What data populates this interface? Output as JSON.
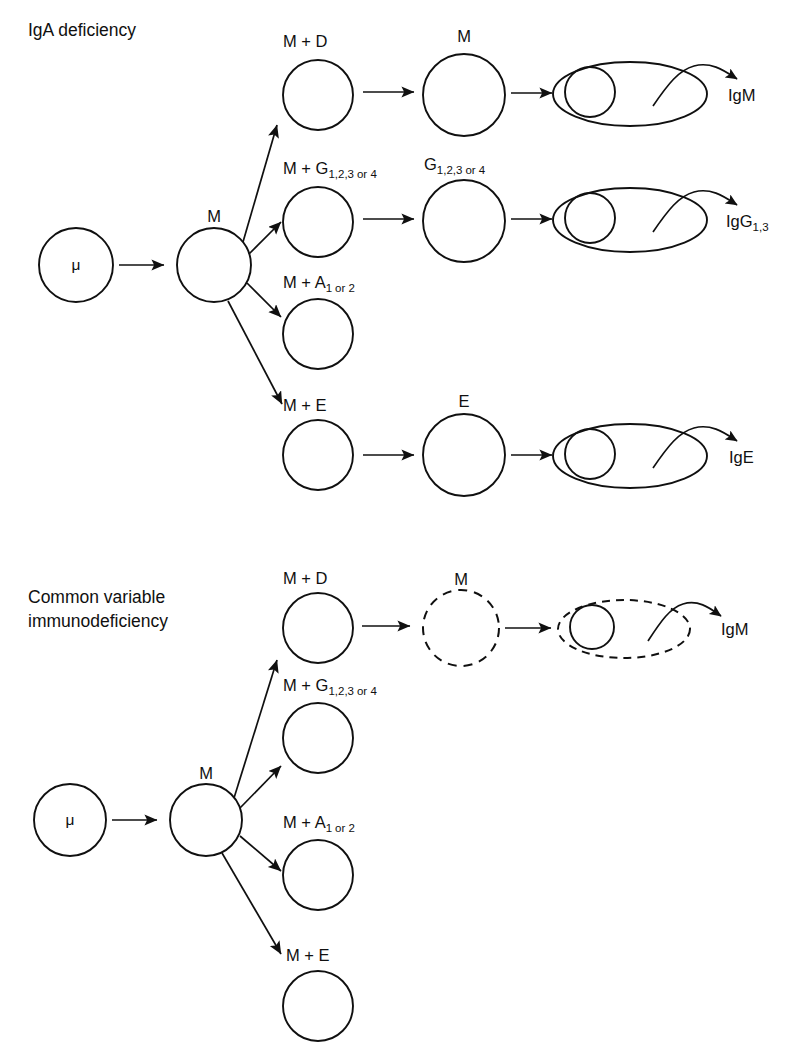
{
  "figure": {
    "background_color": "#ffffff",
    "line_color": "#101010"
  },
  "panels": [
    {
      "id": "iga-deficiency",
      "title": "IgA deficiency",
      "stem_cell": {
        "label": "μ"
      },
      "pre_b_cell": {
        "label": "M"
      },
      "branches": [
        {
          "id": "branch-d",
          "stage1_label_prefix": "M + D",
          "stage1_label_sub": "",
          "stage1_label_suffix": "",
          "stage2_label_prefix": "M",
          "stage2_label_sub": "",
          "stage2_label_suffix": "",
          "has_stage2": true,
          "has_plasma_cell": true,
          "plasma_cell_dashed": false,
          "stage2_dashed": false,
          "secretion_label_prefix": "IgM",
          "secretion_label_sub": ""
        },
        {
          "id": "branch-g",
          "stage1_label_prefix": "M + G",
          "stage1_label_sub": "1,2,3",
          "stage1_label_suffix": "or 4",
          "stage2_label_prefix": "G",
          "stage2_label_sub": "1,2,3",
          "stage2_label_suffix": "or 4",
          "has_stage2": true,
          "has_plasma_cell": true,
          "plasma_cell_dashed": false,
          "stage2_dashed": false,
          "secretion_label_prefix": "IgG",
          "secretion_label_sub": "1,3"
        },
        {
          "id": "branch-a",
          "stage1_label_prefix": "M + A",
          "stage1_label_sub": "1",
          "stage1_label_suffix": "or 2",
          "stage2_label_prefix": "",
          "stage2_label_sub": "",
          "stage2_label_suffix": "",
          "has_stage2": false,
          "has_plasma_cell": false,
          "plasma_cell_dashed": false,
          "stage2_dashed": false,
          "secretion_label_prefix": "",
          "secretion_label_sub": ""
        },
        {
          "id": "branch-e",
          "stage1_label_prefix": "M + E",
          "stage1_label_sub": "",
          "stage1_label_suffix": "",
          "stage2_label_prefix": "E",
          "stage2_label_sub": "",
          "stage2_label_suffix": "",
          "has_stage2": true,
          "has_plasma_cell": true,
          "plasma_cell_dashed": false,
          "stage2_dashed": false,
          "secretion_label_prefix": "IgE",
          "secretion_label_sub": ""
        }
      ]
    },
    {
      "id": "common-variable-immunodeficiency",
      "title_line1": "Common variable",
      "title_line2": "immunodeficiency",
      "stem_cell": {
        "label": "μ"
      },
      "pre_b_cell": {
        "label": "M"
      },
      "branches": [
        {
          "id": "branch-d",
          "stage1_label_prefix": "M + D",
          "stage1_label_sub": "",
          "stage1_label_suffix": "",
          "stage2_label_prefix": "M",
          "stage2_label_sub": "",
          "stage2_label_suffix": "",
          "has_stage2": true,
          "has_plasma_cell": true,
          "plasma_cell_dashed": true,
          "stage2_dashed": true,
          "secretion_label_prefix": "IgM",
          "secretion_label_sub": ""
        },
        {
          "id": "branch-g",
          "stage1_label_prefix": "M + G",
          "stage1_label_sub": "1,2,3",
          "stage1_label_suffix": "or 4",
          "stage2_label_prefix": "",
          "stage2_label_sub": "",
          "stage2_label_suffix": "",
          "has_stage2": false,
          "has_plasma_cell": false,
          "plasma_cell_dashed": false,
          "stage2_dashed": false,
          "secretion_label_prefix": "",
          "secretion_label_sub": ""
        },
        {
          "id": "branch-a",
          "stage1_label_prefix": "M + A",
          "stage1_label_sub": "1",
          "stage1_label_suffix": "or 2",
          "stage2_label_prefix": "",
          "stage2_label_sub": "",
          "stage2_label_suffix": "",
          "has_stage2": false,
          "has_plasma_cell": false,
          "plasma_cell_dashed": false,
          "stage2_dashed": false,
          "secretion_label_prefix": "",
          "secretion_label_sub": ""
        },
        {
          "id": "branch-e",
          "stage1_label_prefix": "M + E",
          "stage1_label_sub": "",
          "stage1_label_suffix": "",
          "stage2_label_prefix": "",
          "stage2_label_sub": "",
          "stage2_label_suffix": "",
          "has_stage2": false,
          "has_plasma_cell": false,
          "plasma_cell_dashed": false,
          "stage2_dashed": false,
          "secretion_label_prefix": "",
          "secretion_label_sub": ""
        }
      ]
    }
  ]
}
